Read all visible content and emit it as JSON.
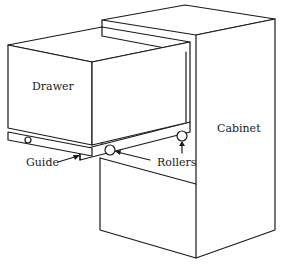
{
  "diagram": {
    "title": "",
    "labels": {
      "drawer": "Drawer",
      "cabinet": "Cabinet",
      "guide": "Guide",
      "rollers": "Rollers"
    },
    "colors": {
      "line": "#1a1a1a",
      "background": "#ffffff"
    }
  }
}
